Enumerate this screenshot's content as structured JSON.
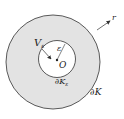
{
  "diagram": {
    "labels": {
      "outer_region": "V",
      "outer_region_sub": "ε",
      "radius": "ε",
      "center": "O",
      "inner_boundary": "∂K",
      "inner_boundary_sub": "ε",
      "outer_boundary": "∂K",
      "normal": "r"
    },
    "colors": {
      "region_fill": "#e3e3e3",
      "stroke": "#333333",
      "hole_fill": "#ffffff"
    }
  }
}
